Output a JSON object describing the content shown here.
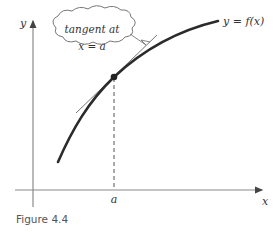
{
  "figure": {
    "caption": "Figure 4.4",
    "y_axis_label": "y",
    "x_axis_label": "x",
    "x_tick_label": "a",
    "curve_label": "y = f(x)",
    "callout": {
      "line1": "tangent at",
      "line2": "x = a"
    },
    "colors": {
      "curve": "#2b2b2b",
      "axes": "#8a8a8a",
      "tangent": "#666666",
      "dashed": "#555555",
      "callout_border": "#777777"
    }
  }
}
